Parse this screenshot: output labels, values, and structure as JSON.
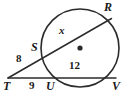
{
  "figure": {
    "kind": "circle-two-secants",
    "background_color": "#ffffff",
    "stroke_color": "#2b2b2b",
    "label_color": "#1a1a1a",
    "circle": {
      "center_x": 80,
      "center_y": 48,
      "radius": 39,
      "center_dot_label": ""
    },
    "points": {
      "R": {
        "label": "R",
        "x": 110,
        "y": 20,
        "label_x": 104,
        "label_y": 1
      },
      "S": {
        "label": "S",
        "x": 45,
        "y": 56,
        "label_x": 31,
        "label_y": 41
      },
      "T": {
        "label": "T",
        "x": 8,
        "y": 78,
        "label_x": 3,
        "label_y": 80
      },
      "U": {
        "label": "U",
        "x": 52,
        "y": 78,
        "label_x": 46,
        "label_y": 80
      },
      "V": {
        "label": "V",
        "x": 114,
        "y": 80,
        "label_x": 112,
        "label_y": 80
      }
    },
    "measures": {
      "ts": {
        "value": "8",
        "x": 16,
        "y": 53
      },
      "tu": {
        "value": "9",
        "x": 29,
        "y": 80
      },
      "uv": {
        "value": "12",
        "x": 69,
        "y": 60
      },
      "sr": {
        "value": "x",
        "x": 59,
        "y": 25
      }
    },
    "segments": [
      {
        "name": "secant-T-S-R",
        "from": "T",
        "to": "R"
      },
      {
        "name": "secant-T-U-V",
        "from": "T",
        "to": "V"
      },
      {
        "name": "chord-U-V",
        "from": "U",
        "to": "V"
      }
    ]
  }
}
